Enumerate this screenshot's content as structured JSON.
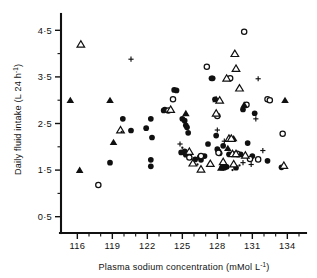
{
  "chart_data": {
    "type": "scatter",
    "title": "",
    "xlabel": "Plasma sodium concentration (mMol L⁻¹)",
    "xlabel_main": "Plasma sodium concentration (mMol L",
    "xlabel_sup": "-1",
    "xlabel_tail": ")",
    "ylabel": "Daily fluid intake (L 24 h⁻¹)",
    "ylabel_main": "Daily fluid intake (L 24 h",
    "ylabel_sup": "-1",
    "ylabel_tail": ")",
    "xlim": [
      114.6,
      135.6
    ],
    "ylim": [
      0.15,
      4.85
    ],
    "xticks": [
      116,
      119,
      122,
      125,
      128,
      131,
      134
    ],
    "xticklabels": [
      "116",
      "119",
      "122",
      "125",
      "128",
      "131",
      "134"
    ],
    "xminorticks": [
      117,
      118,
      120,
      121,
      123,
      124,
      126,
      127,
      129,
      130,
      132,
      133,
      135
    ],
    "yticks": [
      0.5,
      1.5,
      2.5,
      3.5,
      4.5
    ],
    "yticklabels": [
      "0·5",
      "1·5",
      "2·5",
      "3·5",
      "4·5"
    ],
    "yminorticks": [
      1.0,
      2.0,
      3.0,
      4.0
    ],
    "grid": false,
    "legend": "none",
    "marker_kinds": [
      "filled-circle",
      "open-circle",
      "filled-triangle",
      "open-triangle",
      "cross",
      "dot"
    ],
    "series": [
      {
        "name": "filled-circle",
        "marker": "filled-circle",
        "points": [
          [
            118.8,
            1.66
          ],
          [
            119.9,
            2.6
          ],
          [
            120.6,
            2.35
          ],
          [
            121.9,
            2.4
          ],
          [
            122.3,
            2.6
          ],
          [
            122.4,
            2.2
          ],
          [
            122.3,
            1.72
          ],
          [
            122.3,
            1.58
          ],
          [
            123.4,
            2.78
          ],
          [
            124.3,
            3.22
          ],
          [
            124.5,
            3.21
          ],
          [
            125.0,
            2.6
          ],
          [
            125.2,
            2.56
          ],
          [
            125.3,
            2.46
          ],
          [
            125.4,
            2.42
          ],
          [
            125.2,
            1.9
          ],
          [
            125.3,
            1.83
          ],
          [
            125.5,
            2.3
          ],
          [
            126.1,
            1.73
          ],
          [
            126.5,
            1.78
          ],
          [
            126.6,
            1.72
          ],
          [
            127.2,
            2.06
          ],
          [
            127.5,
            3.47
          ],
          [
            127.6,
            3.47
          ],
          [
            127.8,
            3.02
          ],
          [
            127.9,
            2.24
          ],
          [
            128.0,
            1.95
          ],
          [
            128.1,
            1.9
          ],
          [
            128.2,
            1.86
          ],
          [
            128.5,
            2.02
          ],
          [
            128.4,
            1.55
          ],
          [
            128.6,
            1.55
          ],
          [
            128.8,
            1.57
          ],
          [
            129.0,
            1.84
          ],
          [
            129.2,
            1.84
          ],
          [
            129.5,
            1.84
          ],
          [
            129.8,
            1.83
          ],
          [
            129.6,
            1.55
          ],
          [
            130.0,
            1.84
          ],
          [
            130.2,
            2.8
          ],
          [
            130.6,
            2.08
          ],
          [
            131.2,
            2.72
          ],
          [
            131.0,
            1.8
          ],
          [
            132.3,
            1.7
          ],
          [
            133.5,
            1.56
          ],
          [
            126.9,
            1.8
          ],
          [
            124.9,
            1.88
          ],
          [
            123.5,
            2.8
          ]
        ]
      },
      {
        "name": "open-circle",
        "marker": "open-circle",
        "points": [
          [
            117.8,
            1.18
          ],
          [
            124.2,
            3.02
          ],
          [
            123.8,
            2.78
          ],
          [
            126.6,
            1.8
          ],
          [
            127.1,
            3.72
          ],
          [
            128.1,
            1.87
          ],
          [
            128.0,
            2.66
          ],
          [
            129.1,
            3.47
          ],
          [
            129.7,
            1.85
          ],
          [
            130.3,
            4.47
          ],
          [
            130.5,
            2.9
          ],
          [
            131.5,
            1.73
          ],
          [
            132.3,
            3.02
          ],
          [
            132.5,
            3.0
          ],
          [
            133.6,
            2.28
          ],
          [
            130.8,
            1.74
          ],
          [
            125.6,
            1.77
          ]
        ]
      },
      {
        "name": "filled-triangle",
        "marker": "filled-triangle",
        "points": [
          [
            115.4,
            3.0
          ],
          [
            116.2,
            1.5
          ],
          [
            118.8,
            3.0
          ],
          [
            119.1,
            2.1
          ],
          [
            125.3,
            2.72
          ],
          [
            127.9,
            3.02
          ],
          [
            128.3,
            1.55
          ],
          [
            128.5,
            1.58
          ],
          [
            128.9,
            1.97
          ],
          [
            129.4,
            2.18
          ],
          [
            130.3,
            2.9
          ],
          [
            133.8,
            3.0
          ]
        ]
      },
      {
        "name": "open-triangle",
        "marker": "open-triangle",
        "points": [
          [
            116.3,
            4.2
          ],
          [
            119.7,
            2.36
          ],
          [
            124.0,
            2.8
          ],
          [
            125.6,
            1.9
          ],
          [
            125.9,
            1.65
          ],
          [
            126.6,
            1.52
          ],
          [
            127.4,
            1.64
          ],
          [
            127.9,
            2.72
          ],
          [
            128.2,
            3.0
          ],
          [
            128.5,
            1.68
          ],
          [
            129.0,
            2.18
          ],
          [
            129.2,
            2.18
          ],
          [
            129.3,
            1.85
          ],
          [
            129.6,
            1.85
          ],
          [
            129.4,
            1.63
          ],
          [
            129.9,
            3.26
          ],
          [
            129.6,
            3.68
          ],
          [
            129.5,
            4.0
          ],
          [
            128.8,
            3.47
          ],
          [
            133.7,
            1.6
          ],
          [
            130.4,
            1.82
          ]
        ]
      },
      {
        "name": "cross",
        "marker": "cross",
        "points": [
          [
            120.6,
            3.88
          ],
          [
            124.8,
            2.06
          ],
          [
            128.0,
            2.36
          ],
          [
            128.6,
            2.12
          ],
          [
            131.3,
            2.6
          ],
          [
            131.9,
            1.92
          ],
          [
            131.5,
            3.46
          ],
          [
            130.9,
            1.62
          ],
          [
            130.2,
            1.66
          ]
        ]
      },
      {
        "name": "dot",
        "marker": "dot",
        "points": [
          [
            119.8,
            2.32
          ],
          [
            125.0,
            1.98
          ],
          [
            129.9,
            1.6
          ],
          [
            126.3,
            1.62
          ],
          [
            129.3,
            1.5
          ]
        ]
      }
    ]
  },
  "axes": {
    "y_axis_name": "y-axis",
    "x_axis_name": "x-axis"
  }
}
